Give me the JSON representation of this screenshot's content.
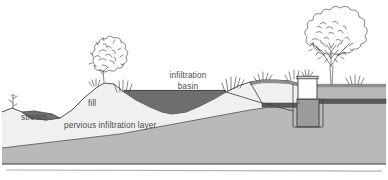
{
  "figure": {
    "type": "cross-section-diagram",
    "width": 388,
    "height": 180,
    "background_color": "#ffffff"
  },
  "labels": {
    "stream": "stream",
    "fill": "fill",
    "pervious_layer": "pervious infiltration layer",
    "basin_line1": "infiltration",
    "basin_line2": "basin"
  },
  "colors": {
    "paper": "#ffffff",
    "fill_body": "#f0f0ee",
    "subsoil": "#b9b9b7",
    "deep_soil": "#b9b9b7",
    "water_dark": "#6e6e6e",
    "water_stream": "#6e6e6e",
    "outline": "#3c3c3c",
    "pipe": "#5a5a5a",
    "structure_white": "#fdfdfd",
    "structure_gray": "#9b9b99",
    "vegetation": "#3a3a3a",
    "text": "#4a4a4a",
    "rule": "#b0b0b0"
  },
  "features": [
    {
      "name": "stream",
      "label": "stream",
      "side": "left"
    },
    {
      "name": "fill-mound",
      "label": "fill",
      "side": "left-center"
    },
    {
      "name": "infiltration-basin",
      "label": "infiltration basin",
      "side": "center"
    },
    {
      "name": "pervious-infiltration-layer",
      "label": "pervious infiltration layer",
      "side": "subsurface"
    },
    {
      "name": "inlet-structure",
      "label": "",
      "side": "right"
    },
    {
      "name": "drain-pipe",
      "label": "",
      "side": "right"
    },
    {
      "name": "large-tree",
      "label": "",
      "side": "right"
    },
    {
      "name": "shrub",
      "label": "",
      "side": "left-center"
    }
  ],
  "footer": {
    "rule_visible": true
  }
}
